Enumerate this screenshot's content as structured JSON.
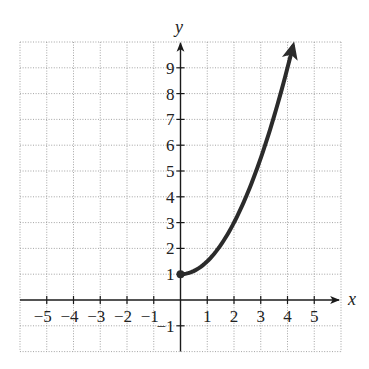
{
  "chart_data": {
    "type": "line",
    "title": "",
    "xlabel": "x",
    "ylabel": "y",
    "xlim": [
      -6,
      6
    ],
    "ylim": [
      -2,
      10
    ],
    "grid": true,
    "x_ticks": [
      -5,
      -4,
      -3,
      -2,
      -1,
      1,
      2,
      3,
      4,
      5
    ],
    "y_ticks": [
      -1,
      1,
      2,
      3,
      4,
      5,
      6,
      7,
      8,
      9
    ],
    "x_tick_labels": [
      "−5",
      "−4",
      "−3",
      "−2",
      "−1",
      "1",
      "2",
      "3",
      "4",
      "5"
    ],
    "y_tick_labels": [
      "−1",
      "1",
      "2",
      "3",
      "4",
      "5",
      "6",
      "7",
      "8",
      "9"
    ],
    "series": [
      {
        "name": "f(x) = x^2/2 + 1, x >= 0",
        "x": [
          0,
          0.5,
          1,
          1.5,
          2,
          2.5,
          3,
          3.5,
          4,
          4.2
        ],
        "y": [
          1,
          1.125,
          1.5,
          2.125,
          3,
          4.125,
          5.5,
          7.125,
          9,
          9.82
        ],
        "start_point": {
          "x": 0,
          "y": 1,
          "marker": "closed-dot"
        },
        "end": "arrow",
        "color": "#2b2b2b"
      }
    ],
    "legend": null
  },
  "labels": {
    "x_axis": "x",
    "y_axis": "y"
  }
}
